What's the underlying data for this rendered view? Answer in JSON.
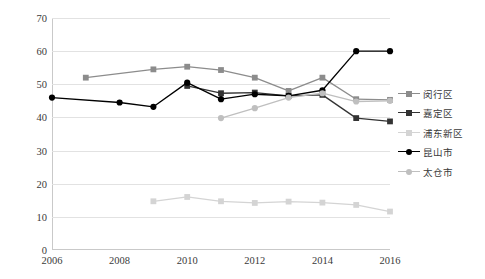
{
  "chart_data": {
    "type": "line",
    "title": "",
    "xlabel": "",
    "ylabel": "镇级可用财力占全区/县财力比重（单位：%）",
    "x": [
      2006,
      2007,
      2008,
      2009,
      2010,
      2011,
      2012,
      2013,
      2014,
      2015,
      2016
    ],
    "xlim": [
      2006,
      2016
    ],
    "ylim": [
      0,
      70
    ],
    "ytick_labels": [
      "0",
      "10",
      "20",
      "30",
      "40",
      "50",
      "60",
      "70"
    ],
    "yticks": [
      0,
      10,
      20,
      30,
      40,
      50,
      60,
      70
    ],
    "xtick_labels": [
      "2006",
      "2008",
      "2010",
      "2012",
      "2014",
      "2016"
    ],
    "xticks": [
      2006,
      2008,
      2010,
      2012,
      2014,
      2016
    ],
    "grid": "horizontal",
    "legend_position": "right",
    "series": [
      {
        "name": "闵行区",
        "color": "#8c8c8c",
        "marker": "square",
        "x": [
          2007,
          2009,
          2010,
          2011,
          2012,
          2013,
          2014,
          2015,
          2016
        ],
        "values": [
          52.0,
          54.5,
          55.3,
          54.3,
          52.0,
          48.0,
          52.0,
          45.5,
          45.3
        ]
      },
      {
        "name": "嘉定区",
        "color": "#333333",
        "marker": "square",
        "x": [
          2010,
          2011,
          2012,
          2013,
          2014,
          2015,
          2016
        ],
        "values": [
          49.5,
          47.3,
          47.5,
          46.5,
          46.8,
          39.8,
          38.8
        ]
      },
      {
        "name": "浦东新区",
        "color": "#d4d4d4",
        "marker": "square",
        "x": [
          2009,
          2010,
          2011,
          2012,
          2013,
          2014,
          2015,
          2016
        ],
        "values": [
          14.7,
          16.0,
          14.7,
          14.2,
          14.6,
          14.3,
          13.6,
          11.6
        ]
      },
      {
        "name": "昆山市",
        "color": "#000000",
        "marker": "circle",
        "x": [
          2006,
          2008,
          2009,
          2010,
          2011,
          2012,
          2013,
          2014,
          2015,
          2016
        ],
        "values": [
          46.0,
          44.5,
          43.2,
          50.5,
          45.5,
          47.0,
          46.5,
          48.2,
          60.0,
          60.0
        ]
      },
      {
        "name": "太仓市",
        "color": "#bfbfbf",
        "marker": "circle",
        "x": [
          2011,
          2012,
          2013,
          2014,
          2015,
          2016
        ],
        "values": [
          39.8,
          42.8,
          46.0,
          47.3,
          44.8,
          45.0
        ]
      }
    ]
  },
  "legend": {
    "items": [
      {
        "label": "闵行区"
      },
      {
        "label": "嘉定区"
      },
      {
        "label": "浦东新区"
      },
      {
        "label": "昆山市"
      },
      {
        "label": "太仓市"
      }
    ]
  }
}
